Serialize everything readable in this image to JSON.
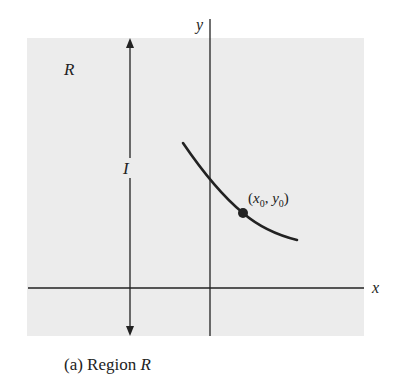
{
  "figure": {
    "region_label": "R",
    "interval_label": "I",
    "x_axis_label": "x",
    "y_axis_label": "y",
    "point_label": "(x0, y0)",
    "point_label_parts": {
      "open": "(",
      "x": "x",
      "x_sub": "0",
      "sep": ", ",
      "y": "y",
      "y_sub": "0",
      "close": ")"
    },
    "caption_prefix": "(a) Region ",
    "caption_var": "R",
    "colors": {
      "region_fill": "#ececec",
      "ink": "#222222",
      "background": "#ffffff"
    }
  }
}
